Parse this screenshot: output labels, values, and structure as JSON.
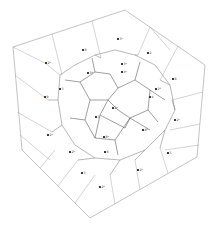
{
  "figure": {
    "background": "#ffffff",
    "line_color": "#8a8a8a",
    "dark_line_color": "#5e5e5e",
    "width": 213,
    "height": 232
  },
  "cube": {
    "top": [
      125,
      10
    ],
    "top_left": [
      13,
      47
    ],
    "top_right": [
      205,
      65
    ],
    "front_top": [
      92,
      33
    ],
    "front_left": [
      22,
      150
    ],
    "front_bottom": [
      90,
      218
    ],
    "bottom_right": [
      197,
      157
    ],
    "center_corner": [
      110,
      90
    ]
  },
  "outer_edges": [
    [
      [
        13,
        47
      ],
      [
        125,
        10
      ]
    ],
    [
      [
        125,
        10
      ],
      [
        205,
        65
      ]
    ],
    [
      [
        205,
        65
      ],
      [
        197,
        157
      ]
    ],
    [
      [
        197,
        157
      ],
      [
        90,
        218
      ]
    ],
    [
      [
        90,
        218
      ],
      [
        22,
        150
      ]
    ],
    [
      [
        22,
        150
      ],
      [
        13,
        47
      ]
    ]
  ],
  "grid_edges": [
    [
      [
        52,
        34
      ],
      [
        62,
        75
      ]
    ],
    [
      [
        92,
        21
      ],
      [
        101,
        58
      ]
    ],
    [
      [
        150,
        27
      ],
      [
        138,
        55
      ]
    ],
    [
      [
        178,
        46
      ],
      [
        160,
        80
      ]
    ],
    [
      [
        15,
        75
      ],
      [
        48,
        100
      ]
    ],
    [
      [
        17,
        112
      ],
      [
        52,
        132
      ]
    ],
    [
      [
        20,
        135
      ],
      [
        50,
        160
      ]
    ],
    [
      [
        40,
        168
      ],
      [
        55,
        150
      ]
    ],
    [
      [
        58,
        186
      ],
      [
        78,
        160
      ]
    ],
    [
      [
        75,
        203
      ],
      [
        95,
        175
      ]
    ],
    [
      [
        115,
        204
      ],
      [
        110,
        175
      ]
    ],
    [
      [
        140,
        190
      ],
      [
        135,
        160
      ]
    ],
    [
      [
        168,
        173
      ],
      [
        160,
        148
      ]
    ],
    [
      [
        203,
        92
      ],
      [
        172,
        100
      ]
    ],
    [
      [
        200,
        124
      ],
      [
        170,
        130
      ]
    ],
    [
      [
        199,
        145
      ],
      [
        165,
        150
      ]
    ],
    [
      [
        13,
        47
      ],
      [
        45,
        63
      ]
    ],
    [
      [
        45,
        63
      ],
      [
        60,
        75
      ]
    ],
    [
      [
        150,
        27
      ],
      [
        170,
        50
      ]
    ]
  ],
  "cell_edges": [
    [
      [
        60,
        75
      ],
      [
        75,
        65
      ]
    ],
    [
      [
        75,
        65
      ],
      [
        95,
        55
      ]
    ],
    [
      [
        95,
        55
      ],
      [
        115,
        50
      ]
    ],
    [
      [
        115,
        50
      ],
      [
        135,
        55
      ]
    ],
    [
      [
        135,
        55
      ],
      [
        155,
        65
      ]
    ],
    [
      [
        155,
        65
      ],
      [
        170,
        85
      ]
    ],
    [
      [
        170,
        85
      ],
      [
        175,
        110
      ]
    ],
    [
      [
        175,
        110
      ],
      [
        165,
        130
      ]
    ],
    [
      [
        165,
        130
      ],
      [
        145,
        150
      ]
    ],
    [
      [
        145,
        150
      ],
      [
        120,
        160
      ]
    ],
    [
      [
        120,
        160
      ],
      [
        95,
        158
      ]
    ],
    [
      [
        95,
        158
      ],
      [
        75,
        145
      ]
    ],
    [
      [
        75,
        145
      ],
      [
        62,
        125
      ]
    ],
    [
      [
        62,
        125
      ],
      [
        58,
        100
      ]
    ],
    [
      [
        58,
        100
      ],
      [
        60,
        75
      ]
    ],
    [
      [
        48,
        100
      ],
      [
        58,
        100
      ]
    ],
    [
      [
        52,
        132
      ],
      [
        62,
        125
      ]
    ],
    [
      [
        78,
        160
      ],
      [
        95,
        158
      ]
    ],
    [
      [
        110,
        175
      ],
      [
        120,
        160
      ]
    ],
    [
      [
        135,
        160
      ],
      [
        145,
        150
      ]
    ],
    [
      [
        160,
        148
      ],
      [
        165,
        130
      ]
    ],
    [
      [
        172,
        100
      ],
      [
        175,
        110
      ]
    ],
    [
      [
        160,
        80
      ],
      [
        170,
        85
      ]
    ],
    [
      [
        138,
        55
      ],
      [
        135,
        55
      ]
    ],
    [
      [
        101,
        58
      ],
      [
        95,
        55
      ]
    ]
  ],
  "inner_edges": [
    [
      [
        80,
        82
      ],
      [
        95,
        72
      ]
    ],
    [
      [
        95,
        72
      ],
      [
        110,
        74
      ]
    ],
    [
      [
        110,
        74
      ],
      [
        118,
        88
      ]
    ],
    [
      [
        118,
        88
      ],
      [
        108,
        100
      ]
    ],
    [
      [
        108,
        100
      ],
      [
        90,
        100
      ]
    ],
    [
      [
        90,
        100
      ],
      [
        80,
        82
      ]
    ],
    [
      [
        118,
        88
      ],
      [
        135,
        80
      ]
    ],
    [
      [
        135,
        80
      ],
      [
        150,
        90
      ]
    ],
    [
      [
        150,
        90
      ],
      [
        148,
        110
      ]
    ],
    [
      [
        148,
        110
      ],
      [
        130,
        118
      ]
    ],
    [
      [
        130,
        118
      ],
      [
        118,
        110
      ]
    ],
    [
      [
        118,
        110
      ],
      [
        108,
        100
      ]
    ],
    [
      [
        90,
        100
      ],
      [
        85,
        120
      ]
    ],
    [
      [
        85,
        120
      ],
      [
        95,
        138
      ]
    ],
    [
      [
        95,
        138
      ],
      [
        115,
        140
      ]
    ],
    [
      [
        115,
        140
      ],
      [
        130,
        118
      ]
    ],
    [
      [
        150,
        90
      ],
      [
        165,
        100
      ]
    ],
    [
      [
        148,
        110
      ],
      [
        158,
        122
      ]
    ],
    [
      [
        115,
        140
      ],
      [
        118,
        155
      ]
    ],
    [
      [
        85,
        120
      ],
      [
        70,
        118
      ]
    ],
    [
      [
        95,
        72
      ],
      [
        92,
        58
      ]
    ],
    [
      [
        135,
        80
      ],
      [
        140,
        62
      ]
    ],
    [
      [
        80,
        82
      ],
      [
        65,
        80
      ]
    ],
    [
      [
        130,
        118
      ],
      [
        150,
        130
      ]
    ],
    [
      [
        100,
        115
      ],
      [
        125,
        128
      ]
    ],
    [
      [
        100,
        115
      ],
      [
        108,
        100
      ]
    ],
    [
      [
        125,
        128
      ],
      [
        130,
        118
      ]
    ],
    [
      [
        100,
        115
      ],
      [
        95,
        138
      ]
    ]
  ],
  "seeds": [
    {
      "x": 118,
      "y": 39,
      "label": "3¹"
    },
    {
      "x": 83,
      "y": 50,
      "label": "8"
    },
    {
      "x": 148,
      "y": 53,
      "label": "2"
    },
    {
      "x": 46,
      "y": 63,
      "label": "2⁹"
    },
    {
      "x": 122,
      "y": 64,
      "label": "3ᵃ"
    },
    {
      "x": 88,
      "y": 73,
      "label": "3⁴"
    },
    {
      "x": 122,
      "y": 72,
      "label": "4ᵇ"
    },
    {
      "x": 173,
      "y": 79,
      "label": "8"
    },
    {
      "x": 156,
      "y": 89,
      "label": "2⁴"
    },
    {
      "x": 60,
      "y": 89,
      "label": "3"
    },
    {
      "x": 45,
      "y": 97,
      "label": "9"
    },
    {
      "x": 113,
      "y": 108,
      "label": "2³"
    },
    {
      "x": 150,
      "y": 97,
      "label": "4"
    },
    {
      "x": 96,
      "y": 117,
      "label": "3"
    },
    {
      "x": 175,
      "y": 120,
      "label": "2⁶"
    },
    {
      "x": 143,
      "y": 130,
      "label": "8⁹"
    },
    {
      "x": 48,
      "y": 135,
      "label": "2⁵"
    },
    {
      "x": 104,
      "y": 137,
      "label": "8ᵃ"
    },
    {
      "x": 70,
      "y": 152,
      "label": "2ᵇ"
    },
    {
      "x": 105,
      "y": 152,
      "label": "8"
    },
    {
      "x": 168,
      "y": 153,
      "label": "5"
    },
    {
      "x": 82,
      "y": 173,
      "label": "3"
    },
    {
      "x": 138,
      "y": 170,
      "label": "2⁵"
    },
    {
      "x": 100,
      "y": 187,
      "label": "2⁵"
    }
  ]
}
